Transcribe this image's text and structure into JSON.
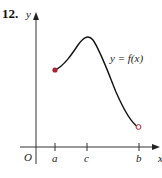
{
  "problem": {
    "number": "12."
  },
  "axes": {
    "y_label": "y",
    "x_label": "x",
    "origin_label": "O",
    "ticks": [
      {
        "label": "a",
        "x": 55
      },
      {
        "label": "c",
        "x": 87
      },
      {
        "label": "b",
        "x": 139
      }
    ]
  },
  "curve": {
    "label": "y = f(x)",
    "color": "#111111",
    "start_point": {
      "type": "closed",
      "color": "#b0202e"
    },
    "end_point": {
      "type": "open",
      "color": "#b0202e"
    }
  }
}
